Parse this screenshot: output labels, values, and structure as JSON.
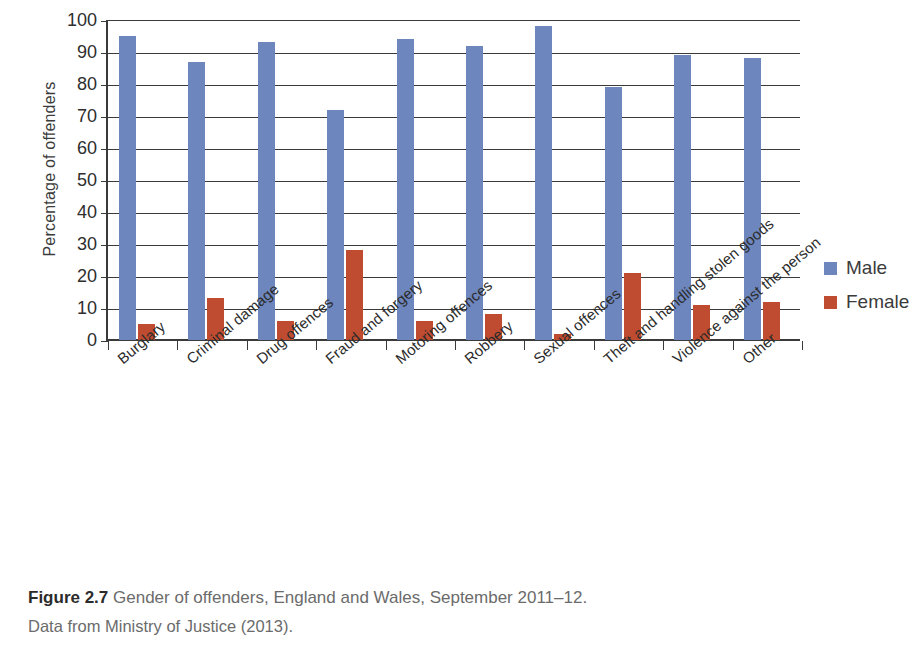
{
  "chart_data": {
    "type": "bar",
    "title": "",
    "xlabel": "",
    "ylabel": "Percentage of offenders",
    "ylim": [
      0,
      100
    ],
    "ytick_step": 10,
    "yticks": [
      100,
      90,
      80,
      70,
      60,
      50,
      40,
      30,
      20,
      10,
      0
    ],
    "grid": "horizontal",
    "legend_position": "right",
    "categories": [
      "Burglary",
      "Criminal damage",
      "Drug offences",
      "Fraud and forgery",
      "Motoring offences",
      "Robbery",
      "Sexual offences",
      "Theft and handling stolen goods",
      "Violence against the person",
      "Other"
    ],
    "series": [
      {
        "name": "Male",
        "color": "#6d86bd",
        "values": [
          95,
          87,
          93,
          72,
          94,
          92,
          98,
          79,
          89,
          88
        ]
      },
      {
        "name": "Female",
        "color": "#bf4c30",
        "values": [
          5,
          13,
          6,
          28,
          6,
          8,
          2,
          21,
          11,
          12
        ]
      }
    ]
  },
  "caption": {
    "figure_number": "Figure 2.7",
    "text": " Gender of offenders, England and Wales, September 2011–12.",
    "source": "Data from Ministry of Justice (2013)."
  }
}
